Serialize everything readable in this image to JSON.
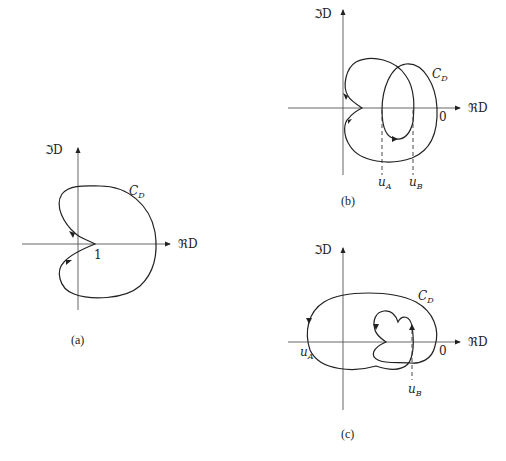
{
  "figure": {
    "colors": {
      "ink": "#222222",
      "axis": "#555555",
      "background": "#ffffff"
    },
    "axis_labels": {
      "imag": "ℑD",
      "real": "ℜD"
    },
    "curve_label": {
      "main": "C",
      "sub": "D"
    },
    "panels": [
      {
        "id": "a",
        "caption": "(a)",
        "point_labels": [
          {
            "text": "1"
          }
        ]
      },
      {
        "id": "b",
        "caption": "(b)",
        "point_labels": [
          {
            "text": "0"
          }
        ],
        "markers": [
          {
            "main": "u",
            "sub": "A"
          },
          {
            "main": "u",
            "sub": "B"
          }
        ]
      },
      {
        "id": "c",
        "caption": "(c)",
        "point_labels": [
          {
            "text": "0"
          }
        ],
        "markers": [
          {
            "main": "u",
            "sub": "A"
          },
          {
            "main": "u",
            "sub": "B"
          }
        ]
      }
    ]
  }
}
